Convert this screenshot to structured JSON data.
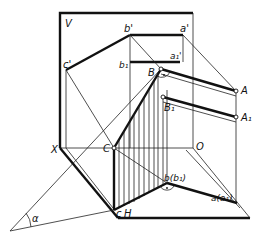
{
  "figure": {
    "labels": {
      "V": "V",
      "b_prime": "b'",
      "a_prime": "a'",
      "c_prime": "c'",
      "b1": "b₁",
      "a1_prime": "a₁'",
      "B": "B",
      "A": "A",
      "B1": "B₁",
      "A1": "A₁",
      "C": "C",
      "X": "X",
      "O": "O",
      "b_b1": "b(b₁)",
      "a_a1": "a(a₁)",
      "c": "c",
      "H": "H",
      "alpha": "α"
    }
  }
}
